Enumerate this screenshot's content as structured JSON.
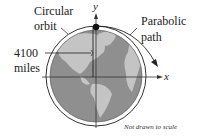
{
  "diagram": {
    "labels": {
      "circular_orbit_line1": "Circular",
      "circular_orbit_line2": "orbit",
      "parabolic_path_line1": "Parabolic",
      "parabolic_path_line2": "path",
      "distance_line1": "4100",
      "distance_line2": "miles",
      "x_axis": "x",
      "y_axis": "y",
      "note": "Not drawn to scale"
    },
    "colors": {
      "earth_ocean": "#8f8f8f",
      "earth_land": "#c4c4c4",
      "orbit": "#333333",
      "satellite": "#111111"
    }
  }
}
